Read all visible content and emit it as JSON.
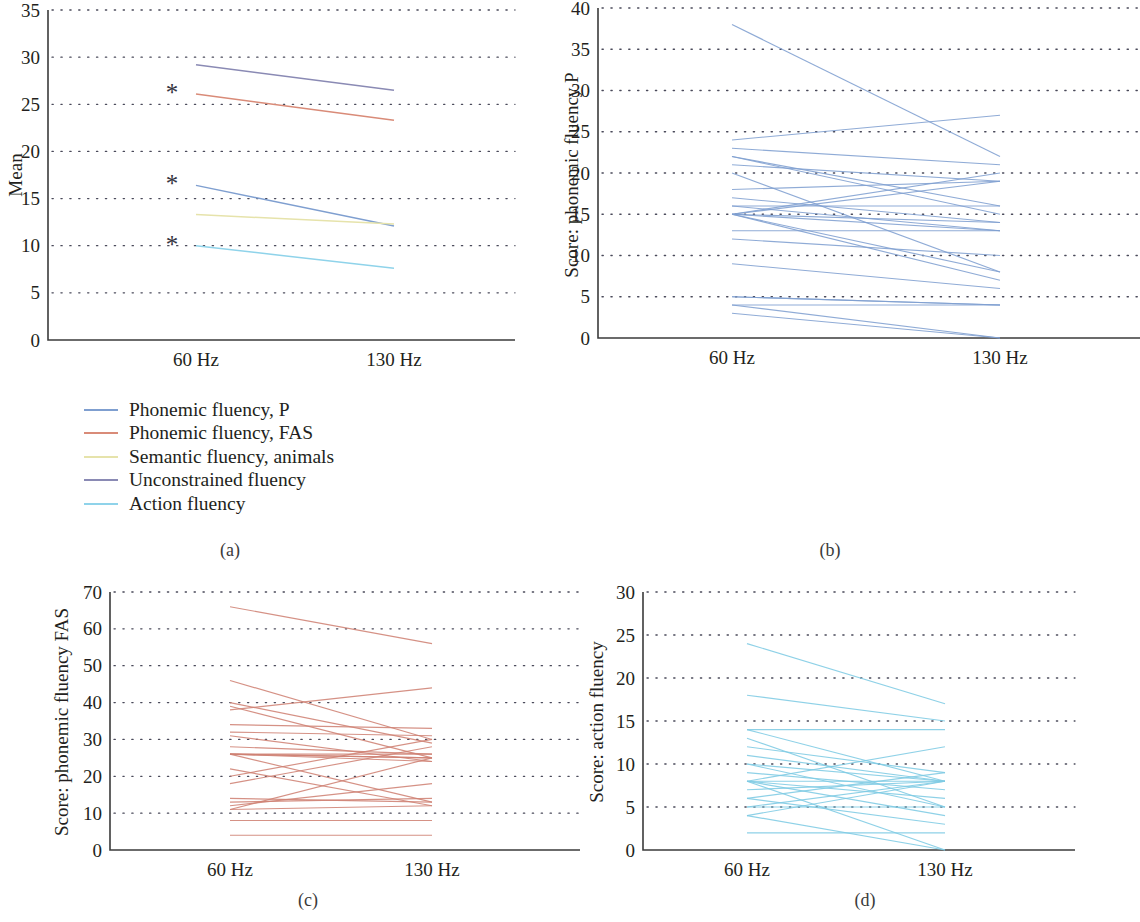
{
  "figure": {
    "panel_captions": {
      "a": "(a)",
      "b": "(b)",
      "c": "(c)",
      "d": "(d)"
    }
  },
  "legend": {
    "items": [
      {
        "label": "Phonemic fluency, P",
        "color": "#7f9fd0"
      },
      {
        "label": "Phonemic fluency, FAS",
        "color": "#d98b78"
      },
      {
        "label": "Semantic fluency, animals",
        "color": "#e6e3ab"
      },
      {
        "label": "Unconstrained fluency",
        "color": "#8a8ab4"
      },
      {
        "label": "Action fluency",
        "color": "#8fd3ea"
      }
    ]
  },
  "chart_data": [
    {
      "id": "panel-a",
      "type": "line",
      "title": "",
      "xlabel": "",
      "ylabel": "Mean",
      "x": [
        "60 Hz",
        "130 Hz"
      ],
      "xticks": [
        "60 Hz",
        "130 Hz"
      ],
      "yticks": [
        0,
        5,
        10,
        15,
        20,
        25,
        30,
        35
      ],
      "ylim": [
        0,
        35
      ],
      "grid": "dotted-horizontal",
      "legend_position": "below-left",
      "annotations": [
        {
          "text": "*",
          "x": "60 Hz",
          "y": 26.1,
          "meaning": "significant"
        },
        {
          "text": "*",
          "x": "60 Hz",
          "y": 16.4,
          "meaning": "significant"
        },
        {
          "text": "*",
          "x": "60 Hz",
          "y": 10.0,
          "meaning": "significant"
        }
      ],
      "series": [
        {
          "name": "Unconstrained fluency",
          "color": "#8a8ab4",
          "values": [
            29.2,
            26.5
          ]
        },
        {
          "name": "Phonemic fluency, FAS",
          "color": "#d98b78",
          "values": [
            26.1,
            23.3
          ]
        },
        {
          "name": "Phonemic fluency, P",
          "color": "#7f9fd0",
          "values": [
            16.4,
            12.1
          ]
        },
        {
          "name": "Semantic fluency, animals",
          "color": "#e6e3ab",
          "values": [
            13.3,
            12.3
          ]
        },
        {
          "name": "Action fluency",
          "color": "#8fd3ea",
          "values": [
            10.0,
            7.6
          ]
        }
      ]
    },
    {
      "id": "panel-b",
      "type": "line",
      "title": "",
      "xlabel": "",
      "ylabel": "Score: phonemic fluency P",
      "x": [
        "60 Hz",
        "130 Hz"
      ],
      "xticks": [
        "60 Hz",
        "130 Hz"
      ],
      "yticks": [
        0,
        5,
        10,
        15,
        20,
        25,
        30,
        35,
        40
      ],
      "ylim": [
        0,
        40
      ],
      "grid": "dotted-horizontal",
      "color": "#7f9fd0",
      "series_note": "individual subject trajectories",
      "pairs": [
        [
          38,
          22
        ],
        [
          24,
          27
        ],
        [
          23,
          21
        ],
        [
          22,
          16
        ],
        [
          22,
          15
        ],
        [
          21,
          19
        ],
        [
          20,
          8
        ],
        [
          18,
          19
        ],
        [
          17,
          14
        ],
        [
          16,
          16
        ],
        [
          16,
          13
        ],
        [
          15,
          20
        ],
        [
          15,
          19
        ],
        [
          15,
          14
        ],
        [
          15,
          13
        ],
        [
          15,
          8
        ],
        [
          15,
          7
        ],
        [
          13,
          13
        ],
        [
          12,
          10
        ],
        [
          9,
          6
        ],
        [
          5,
          4
        ],
        [
          5,
          4
        ],
        [
          4,
          4
        ],
        [
          4,
          0
        ],
        [
          3,
          0
        ]
      ]
    },
    {
      "id": "panel-c",
      "type": "line",
      "title": "",
      "xlabel": "",
      "ylabel": "Score: phonemic fluency FAS",
      "x": [
        "60 Hz",
        "130 Hz"
      ],
      "xticks": [
        "60 Hz",
        "130 Hz"
      ],
      "yticks": [
        0,
        10,
        20,
        30,
        40,
        50,
        60,
        70
      ],
      "ylim": [
        0,
        70
      ],
      "grid": "dotted-horizontal",
      "color": "#cf8274",
      "series_note": "individual subject trajectories",
      "pairs": [
        [
          66,
          56
        ],
        [
          46,
          30
        ],
        [
          40,
          29
        ],
        [
          39,
          25
        ],
        [
          38,
          44
        ],
        [
          34,
          33
        ],
        [
          32,
          31
        ],
        [
          31,
          24
        ],
        [
          28,
          26
        ],
        [
          26,
          25
        ],
        [
          26,
          25
        ],
        [
          26,
          24
        ],
        [
          26,
          13
        ],
        [
          26,
          26
        ],
        [
          22,
          12
        ],
        [
          20,
          30
        ],
        [
          18,
          28
        ],
        [
          14,
          13
        ],
        [
          13,
          14
        ],
        [
          12,
          18
        ],
        [
          11,
          25
        ],
        [
          11,
          12
        ],
        [
          8,
          8
        ],
        [
          4,
          4
        ]
      ]
    },
    {
      "id": "panel-d",
      "type": "line",
      "title": "",
      "xlabel": "",
      "ylabel": "Score: action fluency",
      "x": [
        "60 Hz",
        "130 Hz"
      ],
      "xticks": [
        "60 Hz",
        "130 Hz"
      ],
      "yticks": [
        0,
        5,
        10,
        15,
        20,
        25,
        30
      ],
      "ylim": [
        0,
        30
      ],
      "grid": "dotted-horizontal",
      "color": "#7ecbe4",
      "series_note": "individual subject trajectories",
      "pairs": [
        [
          24,
          17
        ],
        [
          18,
          15
        ],
        [
          14,
          14
        ],
        [
          14,
          8
        ],
        [
          13,
          5
        ],
        [
          12,
          9
        ],
        [
          11,
          8
        ],
        [
          10,
          8
        ],
        [
          10,
          5
        ],
        [
          9,
          7
        ],
        [
          8,
          12
        ],
        [
          8,
          8
        ],
        [
          8,
          6
        ],
        [
          8,
          4
        ],
        [
          8,
          0
        ],
        [
          7,
          8
        ],
        [
          6,
          9
        ],
        [
          6,
          3
        ],
        [
          5,
          8
        ],
        [
          5,
          5
        ],
        [
          4,
          8
        ],
        [
          4,
          0
        ],
        [
          2,
          2
        ]
      ]
    }
  ]
}
